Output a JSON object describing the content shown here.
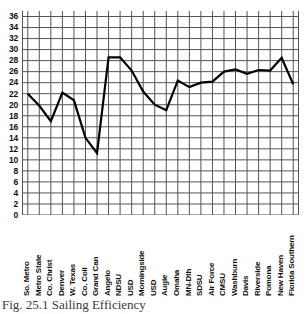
{
  "figure": {
    "caption": "Fig. 25.1 Sailing Efficiency"
  },
  "chart_data": {
    "type": "line",
    "title": "",
    "subtitle": "",
    "xlabel": "",
    "ylabel": "",
    "ylim": [
      0,
      37
    ],
    "yticks": [
      0,
      2,
      4,
      6,
      8,
      10,
      12,
      14,
      16,
      18,
      20,
      22,
      24,
      26,
      28,
      30,
      32,
      34,
      36
    ],
    "ytick_labels": [
      "0",
      "2",
      "4",
      "6",
      "8",
      "10",
      "12",
      "14",
      "16",
      "18",
      "20",
      "22",
      "24",
      "26",
      "28",
      "30",
      "32",
      "34",
      "36"
    ],
    "grid": true,
    "grid_axes": "both",
    "legend": false,
    "legend_position": "none",
    "line_color": "#000000",
    "grid_color": "#555555",
    "categories": [
      "So. Metro",
      "Metro State",
      "Co. Christ",
      "Denver",
      "W. Texas",
      "Co. Coll",
      "Grand Can",
      "Angelo",
      "NDSU",
      "USD",
      "Morningside",
      "USD",
      "Augie",
      "Omaha",
      "MN-Dth",
      "SDSU",
      "Air Force",
      "CMSU",
      "Washburn",
      "Davis",
      "Riverside",
      "Pomona",
      "New Haven",
      "Florida Southern"
    ],
    "values": [
      22.0,
      19.8,
      17.0,
      22.2,
      20.8,
      14.0,
      11.2,
      28.6,
      28.6,
      26.2,
      22.4,
      20.0,
      19.0,
      24.4,
      23.2,
      24.0,
      24.2,
      26.0,
      26.4,
      25.6,
      26.3,
      26.2,
      28.5,
      23.7
    ]
  }
}
